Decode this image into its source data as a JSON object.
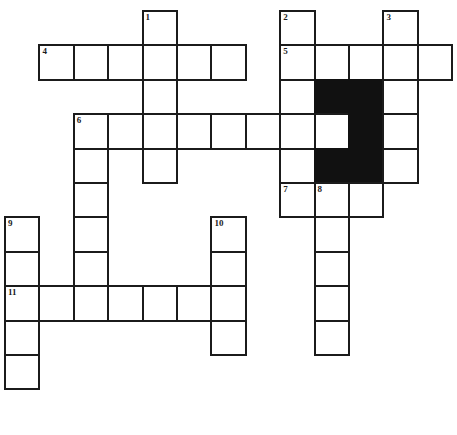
{
  "puzzle": {
    "title": "Crossword Grid",
    "type": "crossword",
    "geometry": {
      "cell_size": 34.4,
      "origin_x": 4,
      "origin_y": 10,
      "columns": 13,
      "rows": 11,
      "line_color": "#1b1b1b",
      "block_color": "#111111",
      "cell_color": "#ffffff"
    },
    "numbers": {
      "n1": "1",
      "n2": "2",
      "n3": "3",
      "n4": "4",
      "n5": "5",
      "n6": "6",
      "n7": "7",
      "n8": "8",
      "n9": "9",
      "n10": "10",
      "n11": "11"
    },
    "clue_starts": [
      {
        "number": "1",
        "col": 4,
        "row": 0,
        "direction": "down",
        "length": 5
      },
      {
        "number": "2",
        "col": 8,
        "row": 0,
        "direction": "down",
        "length": 6
      },
      {
        "number": "3",
        "col": 11,
        "row": 0,
        "direction": "down",
        "length": 5
      },
      {
        "number": "4",
        "col": 1,
        "row": 1,
        "direction": "across",
        "length": 6
      },
      {
        "number": "5",
        "col": 8,
        "row": 1,
        "direction": "across",
        "length": 5
      },
      {
        "number": "6",
        "col": 2,
        "row": 3,
        "direction": "across",
        "length": 9
      },
      {
        "number": "6b",
        "col": 2,
        "row": 3,
        "direction": "down",
        "length": 6
      },
      {
        "number": "7",
        "col": 8,
        "row": 5,
        "direction": "across",
        "length": 3
      },
      {
        "number": "8",
        "col": 9,
        "row": 5,
        "direction": "down",
        "length": 5
      },
      {
        "number": "9",
        "col": 0,
        "row": 6,
        "direction": "down",
        "length": 5
      },
      {
        "number": "10",
        "col": 6,
        "row": 6,
        "direction": "down",
        "length": 4
      },
      {
        "number": "11",
        "col": 0,
        "row": 8,
        "direction": "across",
        "length": 7
      }
    ],
    "cells": [
      {
        "col": 4,
        "row": 0,
        "black": false,
        "number": "1"
      },
      {
        "col": 8,
        "row": 0,
        "black": false,
        "number": "2"
      },
      {
        "col": 11,
        "row": 0,
        "black": false,
        "number": "3"
      },
      {
        "col": 1,
        "row": 1,
        "black": false,
        "number": "4"
      },
      {
        "col": 2,
        "row": 1,
        "black": false,
        "number": ""
      },
      {
        "col": 3,
        "row": 1,
        "black": false,
        "number": ""
      },
      {
        "col": 4,
        "row": 1,
        "black": false,
        "number": ""
      },
      {
        "col": 5,
        "row": 1,
        "black": false,
        "number": ""
      },
      {
        "col": 6,
        "row": 1,
        "black": false,
        "number": ""
      },
      {
        "col": 8,
        "row": 1,
        "black": false,
        "number": "5"
      },
      {
        "col": 9,
        "row": 1,
        "black": false,
        "number": ""
      },
      {
        "col": 10,
        "row": 1,
        "black": false,
        "number": ""
      },
      {
        "col": 11,
        "row": 1,
        "black": false,
        "number": ""
      },
      {
        "col": 12,
        "row": 1,
        "black": false,
        "number": ""
      },
      {
        "col": 4,
        "row": 2,
        "black": false,
        "number": ""
      },
      {
        "col": 8,
        "row": 2,
        "black": false,
        "number": ""
      },
      {
        "col": 9,
        "row": 2,
        "black": true,
        "number": ""
      },
      {
        "col": 10,
        "row": 2,
        "black": true,
        "number": ""
      },
      {
        "col": 11,
        "row": 2,
        "black": false,
        "number": ""
      },
      {
        "col": 2,
        "row": 3,
        "black": false,
        "number": "6"
      },
      {
        "col": 3,
        "row": 3,
        "black": false,
        "number": ""
      },
      {
        "col": 4,
        "row": 3,
        "black": false,
        "number": ""
      },
      {
        "col": 5,
        "row": 3,
        "black": false,
        "number": ""
      },
      {
        "col": 6,
        "row": 3,
        "black": false,
        "number": ""
      },
      {
        "col": 7,
        "row": 3,
        "black": false,
        "number": ""
      },
      {
        "col": 8,
        "row": 3,
        "black": false,
        "number": ""
      },
      {
        "col": 9,
        "row": 3,
        "black": false,
        "number": ""
      },
      {
        "col": 10,
        "row": 3,
        "black": true,
        "number": ""
      },
      {
        "col": 11,
        "row": 3,
        "black": false,
        "number": ""
      },
      {
        "col": 2,
        "row": 4,
        "black": false,
        "number": ""
      },
      {
        "col": 4,
        "row": 4,
        "black": false,
        "number": ""
      },
      {
        "col": 8,
        "row": 4,
        "black": false,
        "number": ""
      },
      {
        "col": 9,
        "row": 4,
        "black": true,
        "number": ""
      },
      {
        "col": 10,
        "row": 4,
        "black": true,
        "number": ""
      },
      {
        "col": 11,
        "row": 4,
        "black": false,
        "number": ""
      },
      {
        "col": 2,
        "row": 5,
        "black": false,
        "number": ""
      },
      {
        "col": 8,
        "row": 5,
        "black": false,
        "number": "7"
      },
      {
        "col": 9,
        "row": 5,
        "black": false,
        "number": "8"
      },
      {
        "col": 10,
        "row": 5,
        "black": false,
        "number": ""
      },
      {
        "col": 0,
        "row": 6,
        "black": false,
        "number": "9"
      },
      {
        "col": 2,
        "row": 6,
        "black": false,
        "number": ""
      },
      {
        "col": 6,
        "row": 6,
        "black": false,
        "number": "10"
      },
      {
        "col": 9,
        "row": 6,
        "black": false,
        "number": ""
      },
      {
        "col": 0,
        "row": 7,
        "black": false,
        "number": ""
      },
      {
        "col": 2,
        "row": 7,
        "black": false,
        "number": ""
      },
      {
        "col": 6,
        "row": 7,
        "black": false,
        "number": ""
      },
      {
        "col": 9,
        "row": 7,
        "black": false,
        "number": ""
      },
      {
        "col": 0,
        "row": 8,
        "black": false,
        "number": "11"
      },
      {
        "col": 1,
        "row": 8,
        "black": false,
        "number": ""
      },
      {
        "col": 2,
        "row": 8,
        "black": false,
        "number": ""
      },
      {
        "col": 3,
        "row": 8,
        "black": false,
        "number": ""
      },
      {
        "col": 4,
        "row": 8,
        "black": false,
        "number": ""
      },
      {
        "col": 5,
        "row": 8,
        "black": false,
        "number": ""
      },
      {
        "col": 6,
        "row": 8,
        "black": false,
        "number": ""
      },
      {
        "col": 9,
        "row": 8,
        "black": false,
        "number": ""
      },
      {
        "col": 0,
        "row": 9,
        "black": false,
        "number": ""
      },
      {
        "col": 6,
        "row": 9,
        "black": false,
        "number": ""
      },
      {
        "col": 9,
        "row": 9,
        "black": false,
        "number": ""
      },
      {
        "col": 0,
        "row": 10,
        "black": false,
        "number": ""
      }
    ]
  }
}
